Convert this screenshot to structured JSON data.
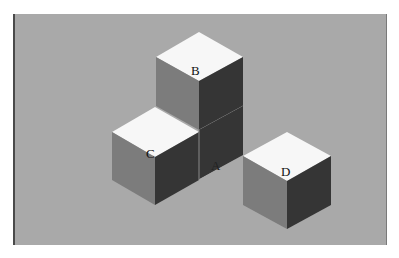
{
  "figure": {
    "colors": {
      "background": "#a9a9a9",
      "top_face": "#f7f7f7",
      "left_face": "#7c7c7c",
      "right_face": "#353535",
      "seam": "#8a8a8a"
    },
    "cubes": [
      {
        "id": "A",
        "label": "A"
      },
      {
        "id": "B",
        "label": "B"
      },
      {
        "id": "C",
        "label": "C"
      },
      {
        "id": "D",
        "label": "D"
      }
    ]
  }
}
